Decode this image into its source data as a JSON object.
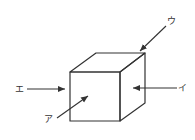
{
  "diagram": {
    "stroke_color": "#333333",
    "background": "#ffffff",
    "cube": {
      "front_face": [
        [
          70,
          72
        ],
        [
          120,
          72
        ],
        [
          120,
          121
        ],
        [
          70,
          121
        ]
      ],
      "top_face": [
        [
          70,
          72
        ],
        [
          96,
          53
        ],
        [
          145,
          53
        ],
        [
          120,
          72
        ]
      ],
      "side_face": [
        [
          120,
          72
        ],
        [
          145,
          53
        ],
        [
          145,
          103
        ],
        [
          120,
          121
        ]
      ]
    },
    "arrows": [
      {
        "id": "a",
        "label": "ア",
        "from": [
          57,
          118
        ],
        "to": [
          88,
          96
        ],
        "label_pos": [
          44,
          115
        ],
        "target": "front face"
      },
      {
        "id": "i",
        "label": "イ",
        "from": [
          177,
          88
        ],
        "to": [
          133,
          88
        ],
        "label_pos": [
          177,
          82
        ],
        "target": "right side face"
      },
      {
        "id": "u",
        "label": "ウ",
        "from": [
          166,
          26
        ],
        "to": [
          140,
          51
        ],
        "label_pos": [
          167,
          17
        ],
        "target": "top back corner"
      },
      {
        "id": "e",
        "label": "エ",
        "from": [
          27,
          89
        ],
        "to": [
          65,
          89
        ],
        "label_pos": [
          16,
          84
        ],
        "target": "front face from left"
      }
    ]
  }
}
